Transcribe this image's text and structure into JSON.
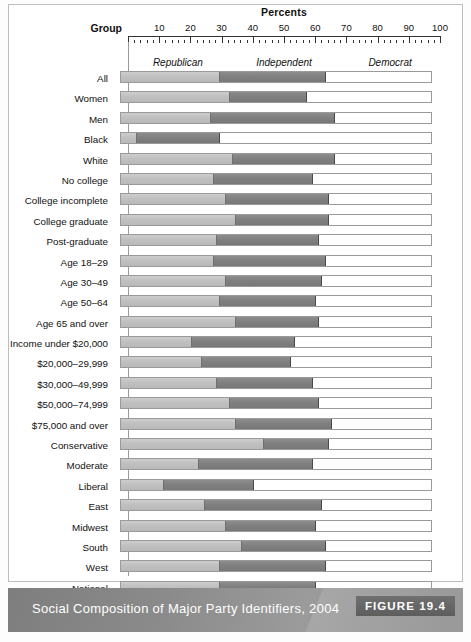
{
  "header": {
    "percents_title": "Percents",
    "group_title": "Group"
  },
  "caption": {
    "text": "Social Composition of Major Party Identifiers, 2004",
    "figure_tag": "FIGURE 19.4"
  },
  "colors": {
    "republican": "#c0c0c0",
    "independent": "#808080",
    "democrat": "#ffffff",
    "bar_border": "#9a9a9a",
    "caption_bar": "#8d8d8d",
    "figure_tag_bg": "#4f4f4f"
  },
  "chart_data": {
    "type": "bar",
    "orientation": "horizontal",
    "stacked": true,
    "title": "Social Composition of Major Party Identifiers, 2004",
    "xlabel": "Percents",
    "ylabel": "Group",
    "xlim": [
      0,
      100
    ],
    "grid": false,
    "legend_position": "top-inside",
    "tick_labels": [
      10,
      20,
      30,
      40,
      50,
      60,
      70,
      80,
      90,
      100
    ],
    "minor_tick_step": 2,
    "legend": [
      "Republican",
      "Independent",
      "Democrat"
    ],
    "categories": [
      "All",
      "Women",
      "Men",
      "Black",
      "White",
      "No college",
      "College incomplete",
      "College graduate",
      "Post-graduate",
      "Age 18–29",
      "Age 30–49",
      "Age 50–64",
      "Age 65 and over",
      "Income under $20,000",
      "$20,000–29,999",
      "$30,000–49,999",
      "$50,000–74,999",
      "$75,000 and over",
      "Conservative",
      "Moderate",
      "Liberal",
      "East",
      "Midwest",
      "South",
      "West",
      "National"
    ],
    "series": [
      {
        "name": "Republican",
        "values": [
          32,
          35,
          29,
          5,
          36,
          30,
          34,
          37,
          31,
          30,
          34,
          32,
          37,
          23,
          26,
          31,
          35,
          37,
          46,
          25,
          14,
          27,
          34,
          39,
          32,
          32
        ]
      },
      {
        "name": "Independent",
        "values": [
          34,
          25,
          40,
          27,
          33,
          32,
          33,
          30,
          33,
          36,
          31,
          31,
          27,
          33,
          29,
          31,
          29,
          31,
          21,
          37,
          29,
          38,
          29,
          27,
          34,
          31
        ]
      },
      {
        "name": "Democrat",
        "values": [
          34,
          40,
          31,
          68,
          31,
          38,
          33,
          33,
          36,
          34,
          35,
          37,
          36,
          44,
          45,
          38,
          36,
          32,
          33,
          38,
          57,
          35,
          37,
          34,
          34,
          37
        ]
      }
    ]
  }
}
